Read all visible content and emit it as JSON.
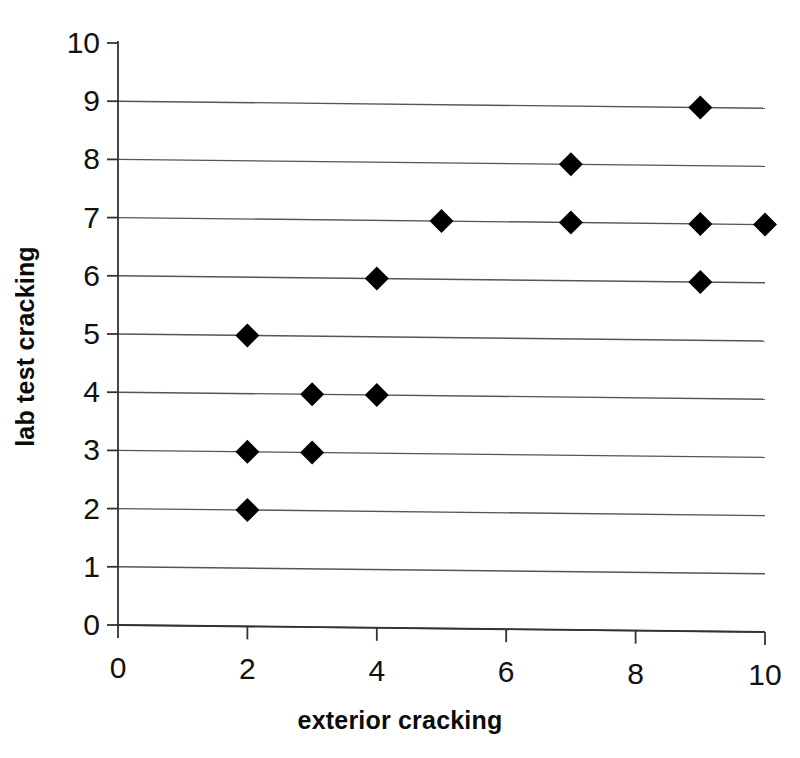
{
  "chart_data": {
    "type": "scatter",
    "title": "",
    "xlabel": "exterior cracking",
    "ylabel": "lab test cracking",
    "xlim": [
      0,
      10
    ],
    "ylim": [
      0,
      10
    ],
    "xticks": [
      0,
      2,
      4,
      6,
      8,
      10
    ],
    "yticks": [
      0,
      1,
      2,
      3,
      4,
      5,
      6,
      7,
      8,
      9,
      10
    ],
    "xtick_labels": [
      "0",
      "2",
      "4",
      "6",
      "8",
      "10"
    ],
    "ytick_labels": [
      "0",
      "1",
      "2",
      "3",
      "4",
      "5",
      "6",
      "7",
      "8",
      "9",
      "10"
    ],
    "grid": "horizontal",
    "legend": "none",
    "marker": "filled-diamond",
    "marker_color": "#000000",
    "grid_color": "#555555",
    "axis_color": "#333333",
    "points": [
      {
        "x": 2,
        "y": 2
      },
      {
        "x": 2,
        "y": 3
      },
      {
        "x": 3,
        "y": 3
      },
      {
        "x": 3,
        "y": 4
      },
      {
        "x": 4,
        "y": 4
      },
      {
        "x": 2,
        "y": 5
      },
      {
        "x": 4,
        "y": 6
      },
      {
        "x": 9,
        "y": 6
      },
      {
        "x": 5,
        "y": 7
      },
      {
        "x": 7,
        "y": 7
      },
      {
        "x": 9,
        "y": 7
      },
      {
        "x": 10,
        "y": 7
      },
      {
        "x": 7,
        "y": 8
      },
      {
        "x": 9,
        "y": 9
      }
    ]
  }
}
